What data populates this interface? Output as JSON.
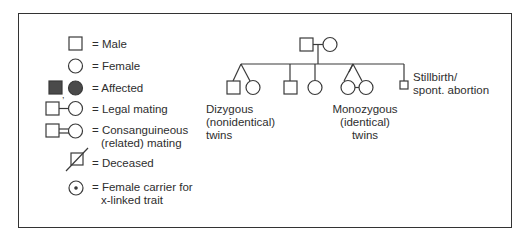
{
  "legend": {
    "items": [
      {
        "symbol": "male-square",
        "label": "= Male"
      },
      {
        "symbol": "female-circle",
        "label": "= Female"
      },
      {
        "symbol": "affected-filled",
        "label": "= Affected"
      },
      {
        "symbol": "legal-mating",
        "label": "= Legal mating"
      },
      {
        "symbol": "consanguineous-mating",
        "label": "= Consanguineous",
        "label2": "(related) mating"
      },
      {
        "symbol": "deceased",
        "label": "= Deceased"
      },
      {
        "symbol": "female-carrier",
        "label": "= Female carrier for",
        "label2": "x-linked trait"
      }
    ]
  },
  "pedigree": {
    "dizygous": {
      "line1": "Dizygous",
      "line2": "(nonidentical)",
      "line3": "twins"
    },
    "monozygous": {
      "line1": "Monozygous",
      "line2": "(identical)",
      "line3": "twins"
    },
    "stillbirth": {
      "line1": "Stillbirth/",
      "line2": "spont. abortion"
    }
  },
  "colors": {
    "stroke": "#3a3a3a",
    "affected_fill": "#4a4a4a",
    "background": "#ffffff"
  }
}
